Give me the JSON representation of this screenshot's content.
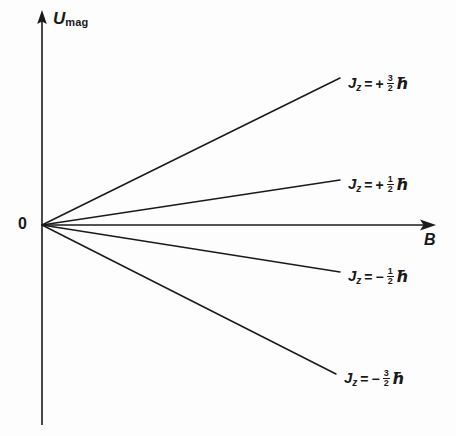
{
  "figure": {
    "background_color": "#fdfdfd",
    "line_color": "#1a1a1a",
    "text_color": "#1a1a1a"
  },
  "axes": {
    "y_label_main": "U",
    "y_label_sub": "mag",
    "x_label": "B",
    "origin_label": "0",
    "x_axis": {
      "start_px": 42,
      "end_px": 434,
      "y_px": 225,
      "arrow": true
    },
    "y_axis": {
      "top_px": 12,
      "bottom_px": 425,
      "x_px": 42,
      "arrow": true
    }
  },
  "chart_data": {
    "type": "line",
    "title": "",
    "xlabel": "B",
    "ylabel": "U_mag",
    "xlim": [
      0,
      1
    ],
    "ylim": [
      -1,
      1
    ],
    "grid": false,
    "legend": "inline-right-of-line-ends",
    "x": [
      0,
      1
    ],
    "series": [
      {
        "name": "Jz = + 3/2 hbar",
        "sign": "+",
        "numerator": "3",
        "denominator": "2",
        "unit": "ħ",
        "slope": 1.0,
        "values": [
          0,
          1.0
        ],
        "end_px": {
          "x": 340,
          "y": 78
        },
        "label_px": {
          "x": 348,
          "y": 74
        }
      },
      {
        "name": "Jz = + 1/2 hbar",
        "sign": "+",
        "numerator": "1",
        "denominator": "2",
        "unit": "ħ",
        "slope": 0.3333,
        "values": [
          0,
          0.3333
        ],
        "end_px": {
          "x": 340,
          "y": 180
        },
        "label_px": {
          "x": 348,
          "y": 175
        }
      },
      {
        "name": "Jz = - 1/2 hbar",
        "sign": "−",
        "numerator": "1",
        "denominator": "2",
        "unit": "ħ",
        "slope": -0.3333,
        "values": [
          0,
          -0.3333
        ],
        "end_px": {
          "x": 340,
          "y": 272
        },
        "label_px": {
          "x": 348,
          "y": 267
        }
      },
      {
        "name": "Jz = - 3/2 hbar",
        "sign": "−",
        "numerator": "3",
        "denominator": "2",
        "unit": "ħ",
        "slope": -1.0,
        "values": [
          0,
          -1.0
        ],
        "end_px": {
          "x": 336,
          "y": 374
        },
        "label_px": {
          "x": 344,
          "y": 369
        }
      }
    ]
  }
}
